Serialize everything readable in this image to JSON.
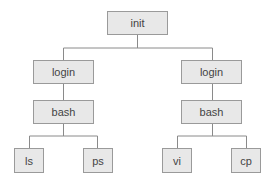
{
  "diagram": {
    "type": "process-tree",
    "colors": {
      "box_fill": "#e8e8e8",
      "box_border": "#9a9a9a",
      "line": "#8a8a8a",
      "text": "#444444"
    },
    "nodes": [
      {
        "id": "init",
        "label": "init",
        "x": 107,
        "y": 11,
        "w": 61,
        "h": 24
      },
      {
        "id": "login1",
        "label": "login",
        "x": 33,
        "y": 60,
        "w": 61,
        "h": 24
      },
      {
        "id": "login2",
        "label": "login",
        "x": 181,
        "y": 60,
        "w": 61,
        "h": 24
      },
      {
        "id": "bash1",
        "label": "bash",
        "x": 33,
        "y": 100,
        "w": 61,
        "h": 24
      },
      {
        "id": "bash2",
        "label": "bash",
        "x": 181,
        "y": 100,
        "w": 61,
        "h": 24
      },
      {
        "id": "ls",
        "label": "ls",
        "x": 14,
        "y": 148,
        "w": 30,
        "h": 25
      },
      {
        "id": "ps",
        "label": "ps",
        "x": 83,
        "y": 148,
        "w": 30,
        "h": 25
      },
      {
        "id": "vi",
        "label": "vi",
        "x": 162,
        "y": 148,
        "w": 30,
        "h": 25
      },
      {
        "id": "cp",
        "label": "cp",
        "x": 231,
        "y": 148,
        "w": 30,
        "h": 25
      }
    ],
    "edges": [
      [
        "init",
        "login1"
      ],
      [
        "init",
        "login2"
      ],
      [
        "login1",
        "bash1"
      ],
      [
        "login2",
        "bash2"
      ],
      [
        "bash1",
        "ls"
      ],
      [
        "bash1",
        "ps"
      ],
      [
        "bash2",
        "vi"
      ],
      [
        "bash2",
        "cp"
      ]
    ]
  }
}
